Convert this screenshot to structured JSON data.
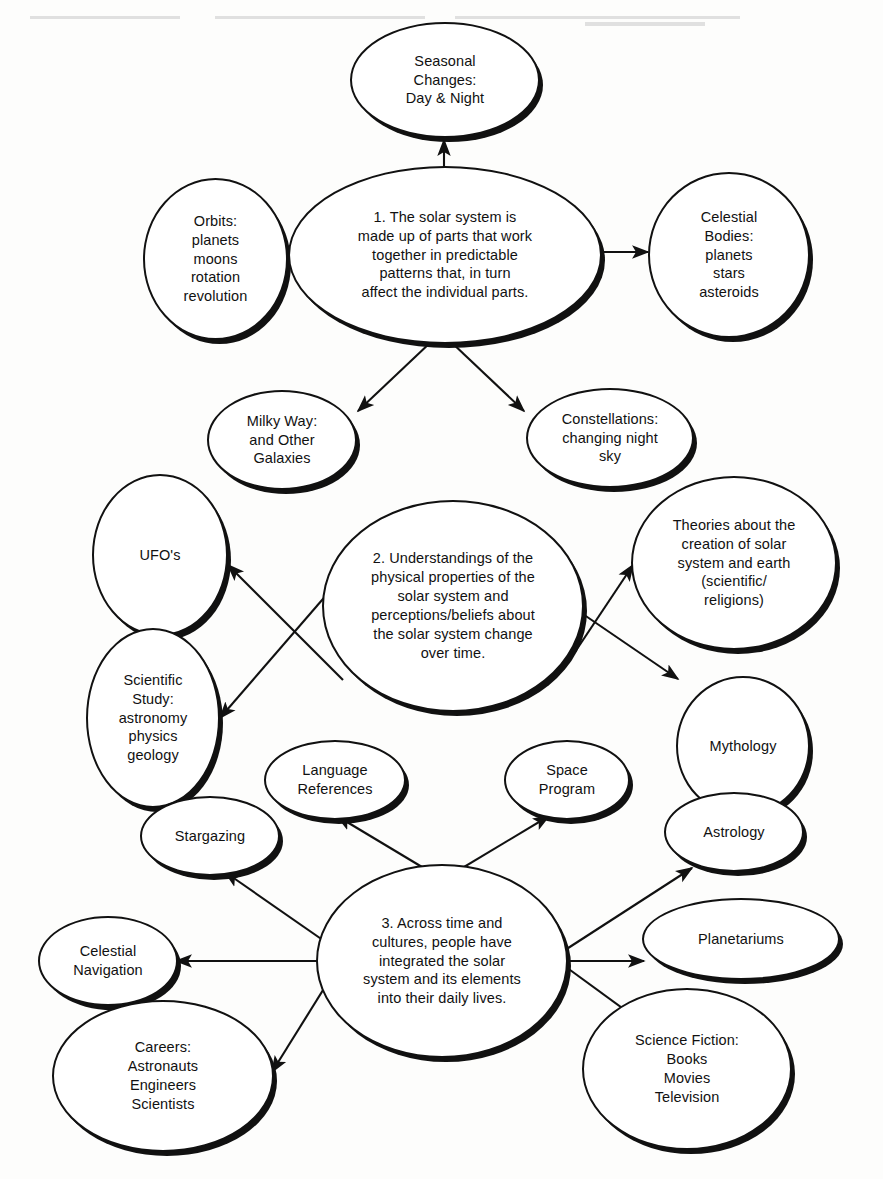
{
  "document": {
    "title": "Solar System Concept Map",
    "type": "concept-map",
    "background_color": "#fdfdfc",
    "ink_color": "#111111"
  },
  "clusters": [
    {
      "id": "cluster-1",
      "center": {
        "id": "topic-1",
        "text": "1.  The solar system is\nmade up of parts that work\ntogether in predictable\npatterns that, in turn\naffect the individual parts.",
        "x": 288,
        "y": 168,
        "w": 312,
        "h": 174
      },
      "satellites": [
        {
          "id": "seasonal-changes",
          "text": "Seasonal\nChanges:\nDay & Night",
          "x": 350,
          "y": 22,
          "w": 190,
          "h": 116
        },
        {
          "id": "orbits",
          "text": "Orbits:\nplanets\nmoons\nrotation\nrevolution",
          "x": 143,
          "y": 178,
          "w": 140,
          "h": 160
        },
        {
          "id": "celestial-bodies",
          "text": "Celestial\nBodies:\nplanets\nstars\nasteroids",
          "x": 652,
          "y": 176,
          "w": 160,
          "h": 162
        },
        {
          "id": "milky-way",
          "text": "Milky Way:\nand Other\nGalaxies",
          "x": 203,
          "y": 390,
          "w": 148,
          "h": 98
        },
        {
          "id": "constellations",
          "text": "Constellations:\nchanging night\nsky",
          "x": 531,
          "y": 388,
          "w": 165,
          "h": 98
        }
      ]
    },
    {
      "id": "cluster-2",
      "center": {
        "id": "topic-2",
        "text": "2.  Understandings of the\nphysical properties of the\nsolar system and\nperceptions/beliefs  about\nthe solar system change\nover time.",
        "x": 324,
        "y": 500,
        "w": 260,
        "h": 208
      },
      "satellites": [
        {
          "id": "ufos",
          "text": "UFO's",
          "x": 86,
          "y": 470,
          "w": 136,
          "h": 162
        },
        {
          "id": "scientific-study",
          "text": "Scientific\nStudy:\nastronomy\nphysics\ngeology",
          "x": 86,
          "y": 782,
          "w": 0,
          "h": 0
        },
        {
          "id": "theories",
          "text": "Theories  about the\ncreation of solar\nsystem and earth\n(scientific/\nreligions)",
          "x": 637,
          "y": 478,
          "w": 204,
          "h": 170
        },
        {
          "id": "mythology",
          "text": "Mythology",
          "x": 670,
          "y": 672,
          "w": 130,
          "h": 138
        }
      ]
    },
    {
      "id": "cluster-3",
      "center": {
        "id": "topic-3",
        "text": "3.  Across time and\ncultures, people have\nintegrated the solar\nsystem and its elements\ninto their daily lives.",
        "x": 317,
        "y": 866,
        "w": 250,
        "h": 190
      },
      "satellites": [
        {
          "id": "language-references",
          "text": "Language\nReferences",
          "x": 258,
          "y": 741,
          "w": 138,
          "h": 82
        },
        {
          "id": "space-program",
          "text": "Space\nProgram",
          "x": 501,
          "y": 741,
          "w": 124,
          "h": 82
        },
        {
          "id": "stargazing",
          "text": "Stargazing",
          "x": 136,
          "y": 798,
          "w": 139,
          "h": 80
        },
        {
          "id": "astrology",
          "text": "Astrology",
          "x": 664,
          "y": 796,
          "w": 139,
          "h": 78
        },
        {
          "id": "celestial-navigation",
          "text": "Celestial\nNavigation",
          "x": 34,
          "y": 901,
          "w": 139,
          "h": 88
        },
        {
          "id": "planetariums",
          "text": "Planetariums",
          "x": 640,
          "y": 898,
          "w": 196,
          "h": 80
        },
        {
          "id": "careers",
          "text": "Careers:\nAstronauts\nEngineers\nScientists",
          "x": 50,
          "y": 1000,
          "w": 220,
          "h": 150
        },
        {
          "id": "science-fiction",
          "text": "Science Fiction:\nBooks\nMovies\nTelevision",
          "x": 580,
          "y": 985,
          "w": 208,
          "h": 160
        }
      ]
    }
  ],
  "nodes": {
    "topic-1": "1.  The solar system is\nmade up of parts that work\ntogether in predictable\npatterns that, in turn\naffect the individual parts.",
    "seasonal-changes": "Seasonal\nChanges:\nDay & Night",
    "orbits": "Orbits:\nplanets\nmoons\nrotation\nrevolution",
    "celestial-bodies": "Celestial\nBodies:\nplanets\nstars\nasteroids",
    "milky-way": "Milky Way:\nand Other\nGalaxies",
    "constellations": "Constellations:\nchanging night\nsky",
    "topic-2": "2.  Understandings of the\nphysical properties of the\nsolar system and\nperceptions/beliefs  about\nthe solar system change\nover time.",
    "ufos": "UFO's",
    "scientific-study": "Scientific\nStudy:\nastronomy\nphysics\ngeology",
    "theories": "Theories  about the\ncreation of solar\nsystem and earth\n(scientific/\nreligions)",
    "mythology": "Mythology",
    "topic-3": "3.  Across time and\ncultures, people have\nintegrated the solar\nsystem and its elements\ninto their daily lives.",
    "language-references": "Language\nReferences",
    "space-program": "Space\nProgram",
    "stargazing": "Stargazing",
    "astrology": "Astrology",
    "celestial-navigation": "Celestial\nNavigation",
    "planetariums": "Planetariums",
    "careers": "Careers:\nAstronauts\nEngineers\nScientists",
    "science-fiction": "Science Fiction:\nBooks\nMovies\nTelevision"
  },
  "edges": [
    {
      "from": "topic-1",
      "to": "seasonal-changes"
    },
    {
      "from": "topic-1",
      "to": "orbits"
    },
    {
      "from": "topic-1",
      "to": "celestial-bodies"
    },
    {
      "from": "topic-1",
      "to": "milky-way"
    },
    {
      "from": "topic-1",
      "to": "constellations"
    },
    {
      "from": "topic-2",
      "to": "ufos"
    },
    {
      "from": "topic-2",
      "to": "scientific-study"
    },
    {
      "from": "topic-2",
      "to": "theories"
    },
    {
      "from": "topic-2",
      "to": "mythology"
    },
    {
      "from": "topic-3",
      "to": "language-references"
    },
    {
      "from": "topic-3",
      "to": "space-program"
    },
    {
      "from": "topic-3",
      "to": "stargazing"
    },
    {
      "from": "topic-3",
      "to": "astrology"
    },
    {
      "from": "topic-3",
      "to": "celestial-navigation"
    },
    {
      "from": "topic-3",
      "to": "planetariums"
    },
    {
      "from": "topic-3",
      "to": "careers"
    },
    {
      "from": "topic-3",
      "to": "science-fiction"
    }
  ]
}
